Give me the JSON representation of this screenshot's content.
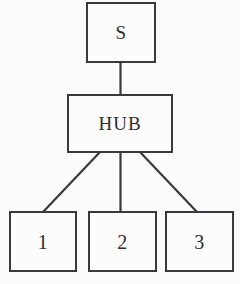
{
  "diagram": {
    "background_color": "#fbfbfb",
    "line_color": "#3a3a3c",
    "text_color": "#2e2e30",
    "nodes": [
      {
        "id": "source",
        "label": "S"
      },
      {
        "id": "hub",
        "label": "HUB"
      },
      {
        "id": "client_1",
        "label": "1"
      },
      {
        "id": "client_2",
        "label": "2"
      },
      {
        "id": "client_3",
        "label": "3"
      }
    ],
    "edges": [
      {
        "from": "source",
        "to": "hub",
        "style": "vertical"
      },
      {
        "from": "hub",
        "to": "client_1",
        "style": "diagonal-left"
      },
      {
        "from": "hub",
        "to": "client_2",
        "style": "vertical"
      },
      {
        "from": "hub",
        "to": "client_3",
        "style": "diagonal-right"
      }
    ]
  }
}
